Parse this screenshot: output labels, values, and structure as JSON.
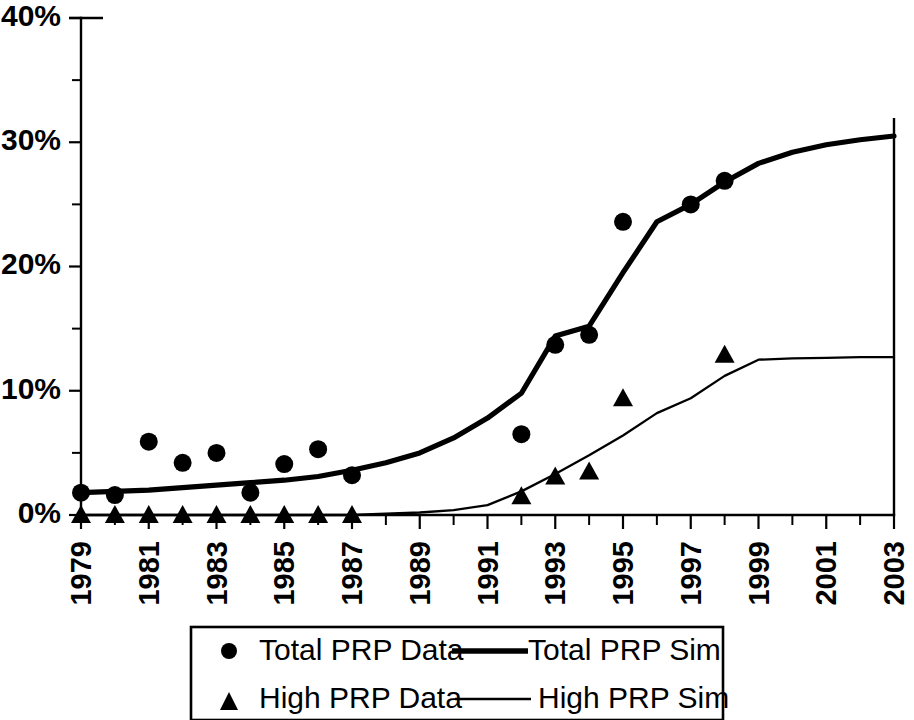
{
  "chart_data": {
    "type": "line",
    "title": "",
    "subtitle": "",
    "xlabel": "",
    "ylabel": "",
    "xlim": [
      1979,
      2003
    ],
    "ylim": [
      0,
      40
    ],
    "y_unit": "%",
    "grid": false,
    "legend_position": "bottom",
    "y_ticks": [
      "0%",
      "10%",
      "20%",
      "30%",
      "40%"
    ],
    "y_tick_values": [
      0,
      10,
      20,
      30,
      40
    ],
    "y_minor_tick_values": [
      5,
      15,
      25,
      35
    ],
    "x_ticks": [
      "1979",
      "1981",
      "1983",
      "1985",
      "1987",
      "1989",
      "1991",
      "1993",
      "1995",
      "1997",
      "1999",
      "2001",
      "2003"
    ],
    "x_tick_values": [
      1979,
      1981,
      1983,
      1985,
      1987,
      1989,
      1991,
      1993,
      1995,
      1997,
      1999,
      2001,
      2003
    ],
    "x_minor_tick_values": [
      1980,
      1982,
      1984,
      1986,
      1988,
      1990,
      1992,
      1994,
      1996,
      1998,
      2000,
      2002
    ],
    "series": [
      {
        "name": "Total PRP Data",
        "marker": "circle",
        "style": "markers",
        "color": "#000000",
        "x": [
          1979,
          1980,
          1981,
          1982,
          1983,
          1984,
          1985,
          1986,
          1987,
          1992,
          1993,
          1994,
          1995,
          1997,
          1998
        ],
        "values": [
          1.8,
          1.6,
          5.9,
          4.2,
          5.0,
          1.8,
          4.1,
          5.3,
          3.2,
          6.5,
          13.7,
          14.5,
          23.6,
          25.0,
          26.9
        ]
      },
      {
        "name": "Total PRP Sim",
        "marker": "none",
        "style": "line-thick",
        "color": "#000000",
        "x": [
          1979,
          1980,
          1981,
          1982,
          1983,
          1984,
          1985,
          1986,
          1987,
          1988,
          1989,
          1990,
          1991,
          1992,
          1993,
          1994,
          1995,
          1996,
          1997,
          1998,
          1999,
          2000,
          2001,
          2002,
          2003
        ],
        "values": [
          1.8,
          1.9,
          2.0,
          2.2,
          2.4,
          2.6,
          2.8,
          3.1,
          3.6,
          4.2,
          5.0,
          6.2,
          7.8,
          9.8,
          14.4,
          15.2,
          19.5,
          23.6,
          25.0,
          26.8,
          28.3,
          29.2,
          29.8,
          30.2,
          30.5
        ]
      },
      {
        "name": "High PRP Data",
        "marker": "triangle",
        "style": "markers",
        "color": "#000000",
        "x": [
          1979,
          1980,
          1981,
          1982,
          1983,
          1984,
          1985,
          1986,
          1987,
          1992,
          1993,
          1994,
          1995,
          1998
        ],
        "values": [
          0.0,
          0.0,
          0.0,
          0.0,
          0.0,
          0.0,
          0.0,
          0.0,
          0.0,
          1.5,
          3.1,
          3.5,
          9.4,
          12.9
        ]
      },
      {
        "name": "High PRP Sim",
        "marker": "none",
        "style": "line-thin",
        "color": "#000000",
        "x": [
          1979,
          1980,
          1981,
          1982,
          1983,
          1984,
          1985,
          1986,
          1987,
          1988,
          1989,
          1990,
          1991,
          1992,
          1993,
          1994,
          1995,
          1996,
          1997,
          1998,
          1999,
          2000,
          2001,
          2002,
          2003
        ],
        "values": [
          0.0,
          0.0,
          0.0,
          0.0,
          0.0,
          0.0,
          0.0,
          0.0,
          0.0,
          0.1,
          0.2,
          0.4,
          0.8,
          1.9,
          3.3,
          4.8,
          6.4,
          8.2,
          9.4,
          11.2,
          12.5,
          12.6,
          12.65,
          12.7,
          12.7
        ]
      }
    ]
  },
  "legend": {
    "entries": [
      {
        "label": "Total PRP Data",
        "symbol": "circle-marker"
      },
      {
        "label": "Total PRP Sim",
        "symbol": "thick-line"
      },
      {
        "label": "High PRP Data",
        "symbol": "triangle-marker"
      },
      {
        "label": "High PRP Sim",
        "symbol": "thin-line"
      }
    ]
  }
}
